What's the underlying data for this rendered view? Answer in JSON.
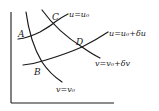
{
  "diagram": {
    "type": "curvilinear-coordinate-grid",
    "points": {
      "A": "A",
      "B": "B",
      "C": "C",
      "D": "D"
    },
    "curves": {
      "u0": "u=u₀",
      "u0_du": "u=u₀+δu",
      "v0": "v=v₀",
      "v0_dv": "v=v₀+δv"
    },
    "colors": {
      "stroke": "#1a1a1a",
      "background": "#ffffff"
    }
  }
}
